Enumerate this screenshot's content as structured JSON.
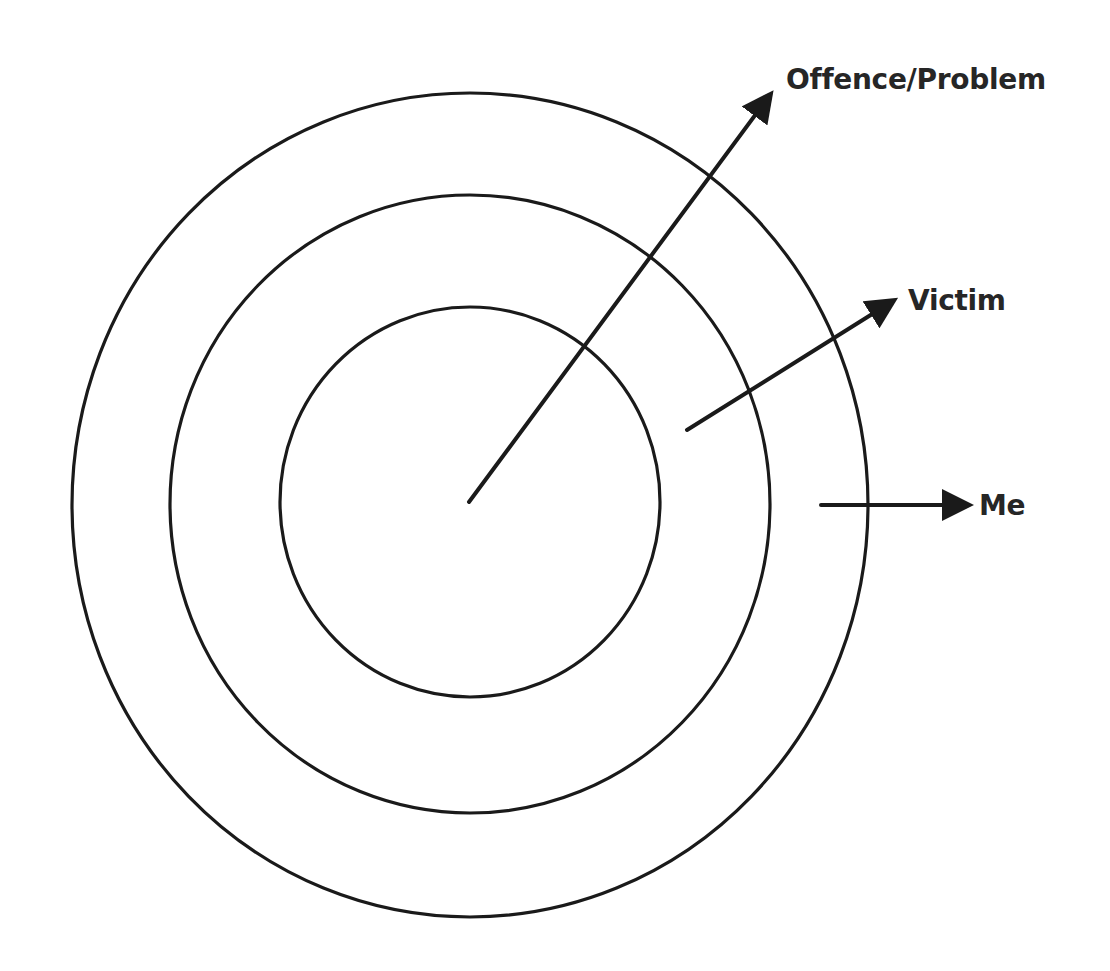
{
  "diagram": {
    "type": "concentric-circles",
    "colors": {
      "stroke": "#1a1a1a",
      "text": "#262626",
      "background": "#ffffff"
    },
    "rings": [
      {
        "name": "inner",
        "cx": 470,
        "cy": 502,
        "rx": 190,
        "ry": 195
      },
      {
        "name": "middle",
        "cx": 470,
        "cy": 504,
        "rx": 300,
        "ry": 309
      },
      {
        "name": "outer",
        "cx": 470,
        "cy": 505,
        "rx": 398,
        "ry": 412
      }
    ],
    "arrows": [
      {
        "name": "offence-problem",
        "x1": 469,
        "y1": 502,
        "x2": 770,
        "y2": 95
      },
      {
        "name": "victim",
        "x1": 687,
        "y1": 430,
        "x2": 893,
        "y2": 301
      },
      {
        "name": "me",
        "x1": 821,
        "y1": 505,
        "x2": 968,
        "y2": 505
      }
    ],
    "labels": {
      "offence_problem": "Offence/Problem",
      "victim": "Victim",
      "me": "Me"
    }
  }
}
